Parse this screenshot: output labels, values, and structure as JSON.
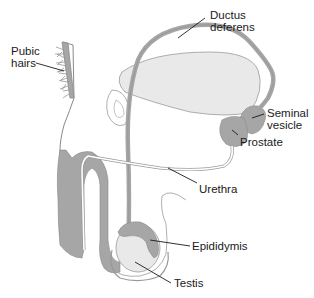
{
  "diagram": {
    "title": "",
    "colors": {
      "tissue_dark": "#a6a6a6",
      "tissue_light": "#e9e9e9",
      "outline": "#8a8a8a",
      "leader_line": "#1a1a1a",
      "label_text": "#1a1a1a",
      "background": "#ffffff"
    },
    "labels": [
      {
        "id": "pubic-hairs",
        "lines": [
          "Pubic",
          "hairs"
        ]
      },
      {
        "id": "ductus-deferens",
        "lines": [
          "Ductus",
          "deferens"
        ]
      },
      {
        "id": "seminal-vesicle",
        "lines": [
          "Seminal",
          "vesicle"
        ]
      },
      {
        "id": "prostate",
        "lines": [
          "Prostate"
        ]
      },
      {
        "id": "urethra",
        "lines": [
          "Urethra"
        ]
      },
      {
        "id": "epididymis",
        "lines": [
          "Epididymis"
        ]
      },
      {
        "id": "testis",
        "lines": [
          "Testis"
        ]
      }
    ]
  }
}
